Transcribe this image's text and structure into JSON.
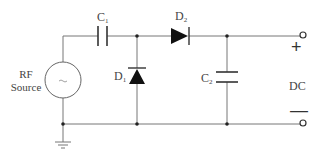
{
  "diagram": {
    "colors": {
      "wire": "#777777",
      "component": "#333333",
      "text": "#444444",
      "background": "#ffffff"
    },
    "source": {
      "label_line1": "RF",
      "label_line2": "Source",
      "symbol": "ac-source-circle",
      "inner_glyph": "~"
    },
    "components": {
      "c1": {
        "name": "C",
        "sub": "1",
        "type": "capacitor"
      },
      "d1": {
        "name": "D",
        "sub": "1",
        "type": "diode"
      },
      "d2": {
        "name": "D",
        "sub": "2",
        "type": "diode"
      },
      "c2": {
        "name": "C",
        "sub": "2",
        "type": "capacitor"
      }
    },
    "output": {
      "label": "DC",
      "plus": "+",
      "minus": "—"
    },
    "ground": {
      "symbol": "ground-icon"
    }
  }
}
